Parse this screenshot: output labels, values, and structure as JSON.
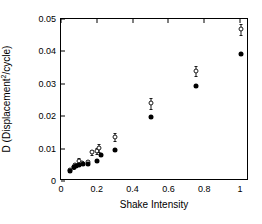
{
  "chart_data": {
    "type": "scatter",
    "title": "",
    "xlabel": "Shake Intensity",
    "ylabel": "D (Displacement2/cycle)",
    "ylabel_base": "D (Displacement",
    "ylabel_exponent": "2",
    "ylabel_tail": "/cycle)",
    "xlim": [
      0,
      1.05
    ],
    "ylim": [
      0,
      0.05
    ],
    "xticks": [
      0,
      0.2,
      0.4,
      0.6,
      0.8,
      1
    ],
    "xticklabels": [
      "0",
      "0.2",
      "0.4",
      "0.6",
      "0.8",
      "1"
    ],
    "yticks": [
      0,
      0.01,
      0.02,
      0.03,
      0.04,
      0.05
    ],
    "yticklabels": [
      "0",
      "0.01",
      "0.02",
      "0.03",
      "0.04",
      "0.05"
    ],
    "grid": false,
    "legend": "none",
    "series": [
      {
        "name": "open-circle-with-error-bars",
        "marker": "open-circle",
        "color": "#1a1a1a",
        "has_error_bars": true,
        "points": [
          {
            "x": 0.05,
            "y": 0.0033,
            "yerr": 0.0006
          },
          {
            "x": 0.07,
            "y": 0.0044,
            "yerr": 0.0006
          },
          {
            "x": 0.08,
            "y": 0.005,
            "yerr": 0.0007
          },
          {
            "x": 0.1,
            "y": 0.0063,
            "yerr": 0.0008
          },
          {
            "x": 0.12,
            "y": 0.0055,
            "yerr": 0.0006
          },
          {
            "x": 0.15,
            "y": 0.006,
            "yerr": 0.0006
          },
          {
            "x": 0.175,
            "y": 0.0089,
            "yerr": 0.0008
          },
          {
            "x": 0.2,
            "y": 0.0093,
            "yerr": 0.001
          },
          {
            "x": 0.215,
            "y": 0.0101,
            "yerr": 0.0013
          },
          {
            "x": 0.3,
            "y": 0.0136,
            "yerr": 0.0013
          },
          {
            "x": 0.505,
            "y": 0.024,
            "yerr": 0.0017
          },
          {
            "x": 0.755,
            "y": 0.034,
            "yerr": 0.0016
          },
          {
            "x": 1.005,
            "y": 0.0468,
            "yerr": 0.0018
          }
        ]
      },
      {
        "name": "filled-circle",
        "marker": "filled-circle",
        "color": "#000000",
        "has_error_bars": false,
        "points": [
          {
            "x": 0.05,
            "y": 0.003
          },
          {
            "x": 0.07,
            "y": 0.0042
          },
          {
            "x": 0.085,
            "y": 0.0047
          },
          {
            "x": 0.1,
            "y": 0.005
          },
          {
            "x": 0.125,
            "y": 0.0051
          },
          {
            "x": 0.15,
            "y": 0.0053
          },
          {
            "x": 0.2,
            "y": 0.0061
          },
          {
            "x": 0.225,
            "y": 0.008
          },
          {
            "x": 0.3,
            "y": 0.0096
          },
          {
            "x": 0.505,
            "y": 0.0199
          },
          {
            "x": 0.755,
            "y": 0.0293
          },
          {
            "x": 1.005,
            "y": 0.0393
          }
        ]
      }
    ]
  }
}
